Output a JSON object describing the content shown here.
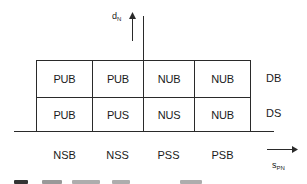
{
  "diagram": {
    "vertical_axis": {
      "symbol": "d",
      "subscript": "N"
    },
    "horizontal_axis": {
      "symbol": "s",
      "subscript": "PN"
    },
    "rows": [
      {
        "label": "DB",
        "cells": [
          "PUB",
          "PUB",
          "NUB",
          "NUB"
        ]
      },
      {
        "label": "DS",
        "cells": [
          "PUB",
          "PUS",
          "NUS",
          "NUB"
        ]
      }
    ],
    "column_labels": [
      "NSB",
      "NSS",
      "PSS",
      "PSB"
    ],
    "line_color": "#2a2a2a",
    "background_color": "#ffffff"
  }
}
